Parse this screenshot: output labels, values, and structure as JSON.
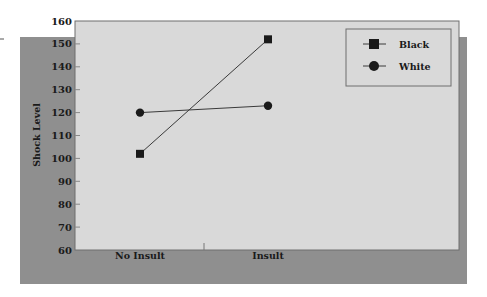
{
  "chart_data": {
    "type": "line",
    "title": "",
    "xlabel": "",
    "ylabel": "Shock Level",
    "categories": [
      "No Insult",
      "Insult"
    ],
    "series": [
      {
        "name": "Black",
        "marker": "square",
        "values": [
          102,
          152
        ]
      },
      {
        "name": "White",
        "marker": "circle",
        "values": [
          120,
          123
        ]
      }
    ],
    "ylim": [
      60,
      160
    ],
    "yticks": [
      60,
      70,
      80,
      90,
      100,
      110,
      120,
      130,
      140,
      150,
      160
    ],
    "grid": false,
    "legend_position": "upper right"
  },
  "colors": {
    "plot_background": "#d9d9d9",
    "shadow_background": "#8f8f8f",
    "plot_border": "#6e6e6e",
    "series_line": "#3a3a3a",
    "marker": "#1a1a1a",
    "text": "#1a1a1a"
  }
}
